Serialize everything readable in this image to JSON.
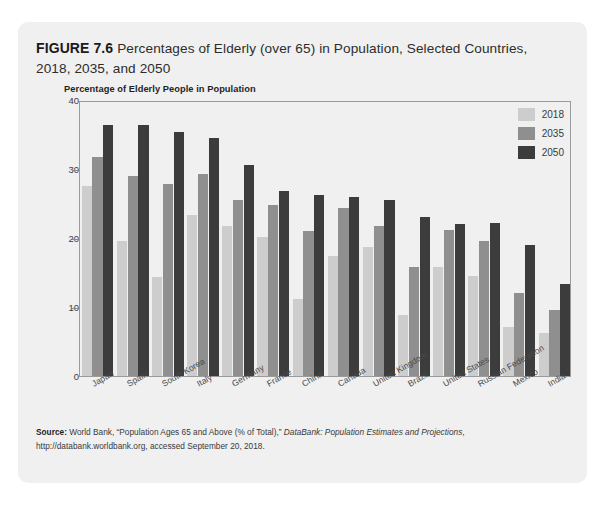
{
  "figure": {
    "number_label": "FIGURE 7.6",
    "title_rest": " Percentages of Elderly (over 65) in Population, Selected Countries, 2018, 2035, and 2050"
  },
  "chart_subtitle": "Percentage of Elderly People in Population",
  "source": {
    "label": "Source:",
    "text_1": " World Bank, “Population Ages 65 and Above (% of Total),” ",
    "italic_1": "DataBank: Population Estimates and Projections",
    "text_2": ", http://databank.worldbank.org, accessed September 20, 2018."
  },
  "legend": {
    "items": [
      {
        "label": "2018",
        "color": "#cdcdcd"
      },
      {
        "label": "2035",
        "color": "#8f8f8f"
      },
      {
        "label": "2050",
        "color": "#3c3c3c"
      }
    ]
  },
  "chart_data": {
    "type": "bar",
    "title": "Percentages of Elderly (over 65) in Population, Selected Countries, 2018, 2035, and 2050",
    "subtitle": "Percentage of Elderly People in Population",
    "xlabel": "",
    "ylabel": "",
    "ylim": [
      0,
      40
    ],
    "yticks": [
      0,
      10,
      20,
      30,
      40
    ],
    "ytick_labels": [
      "0",
      "10",
      "20",
      "30",
      "40"
    ],
    "grid": false,
    "legend_position": "top-right",
    "categories": [
      "Japan",
      "Spain",
      "South Korea",
      "Italy",
      "Germany",
      "France",
      "China",
      "Canada",
      "United Kingdom",
      "Brazil",
      "United States",
      "Russian Federation",
      "Mexico",
      "India"
    ],
    "series": [
      {
        "name": "2018",
        "color": "#cdcdcd",
        "values": [
          27.6,
          19.6,
          14.3,
          23.4,
          21.7,
          20.1,
          11.2,
          17.4,
          18.7,
          8.9,
          15.8,
          14.5,
          7.1,
          6.2
        ]
      },
      {
        "name": "2035",
        "color": "#8f8f8f",
        "values": [
          31.8,
          29.0,
          27.8,
          29.3,
          25.5,
          24.8,
          21.0,
          24.4,
          21.7,
          15.8,
          21.2,
          19.5,
          12.1,
          9.6
        ]
      },
      {
        "name": "2050",
        "color": "#3c3c3c",
        "values": [
          36.4,
          36.4,
          35.3,
          34.5,
          30.6,
          26.8,
          26.3,
          25.9,
          25.5,
          23.1,
          22.1,
          22.2,
          19.0,
          13.4
        ]
      }
    ]
  }
}
